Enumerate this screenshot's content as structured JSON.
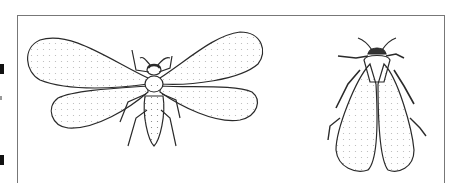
{
  "figure": {
    "panels": [
      {
        "id": "left",
        "description": "adult insect with wings spread"
      },
      {
        "id": "right",
        "description": "adult insect with wings folded at rest"
      }
    ],
    "colors": {
      "ink": "#2a2a2a",
      "stipple": "#6b6b6b",
      "frame": "#777777",
      "background": "#ffffff"
    }
  }
}
